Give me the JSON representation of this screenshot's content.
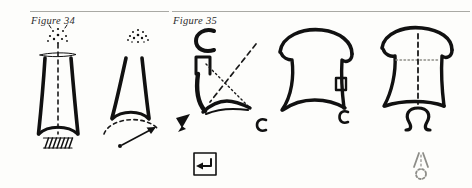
{
  "page": {
    "background_color": "#fdfdfb",
    "ink_color": "#111111",
    "rule_color": "#a9a9a4",
    "faint_ink_color": "#8d8d88"
  },
  "panels": [
    {
      "id": "figure-34",
      "label": "Figure 34",
      "rule": true,
      "drawings": [
        {
          "id": "drawing-1",
          "description": "Tapering vessel outline with dashed vertical axis, horizontal crossbar at the neck, a small burst of dots above, a curved base arc and a hatched block beneath",
          "elements": [
            "burst-dots",
            "dashed-center-axis",
            "horizontal-crossbar",
            "tapered-body-left-stroke",
            "tapered-body-right-stroke",
            "base-arc",
            "hatch-block"
          ]
        },
        {
          "id": "drawing-2",
          "description": "V-shaped vessel outline with a burst of dots above, a dashed arc across the base and an arrow rising from a dot at lower left",
          "elements": [
            "burst-dots",
            "v-left-stroke",
            "v-right-stroke",
            "base-curve",
            "dashed-arc",
            "arrow",
            "origin-dot"
          ]
        }
      ]
    },
    {
      "id": "figure-35",
      "label": "Figure 35",
      "rule": true,
      "drawings": [
        {
          "id": "drawing-3",
          "description": "Letter C above a narrow tube, a curving downstroke, crossing dashed and dotted guide lines, a solid wedge at lower left and a small letter c at lower right",
          "glyphs": [
            "C",
            "c"
          ],
          "elements": [
            "c-glyph-top",
            "tube",
            "curved-downstroke",
            "dashed-guide",
            "dotted-guide",
            "sweep-stroke",
            "wedge",
            "c-glyph-small"
          ]
        },
        {
          "id": "drawing-4",
          "description": "Domed bell outline with an inner notch, a sweeping base curve and a small letter c at lower right",
          "glyphs": [
            "c"
          ],
          "elements": [
            "dome-outline",
            "left-downstroke",
            "right-downstroke",
            "notch",
            "base-curve",
            "c-glyph-small"
          ]
        },
        {
          "id": "drawing-5",
          "description": "Domed bell outline with a dashed vertical axis, a horizontal base bar and an omega symbol below",
          "glyphs": [
            "Ω"
          ],
          "elements": [
            "dome-outline",
            "left-downstroke",
            "right-downstroke",
            "dashed-center-axis",
            "base-bar",
            "omega-glyph"
          ]
        }
      ]
    }
  ],
  "marks": [
    {
      "id": "return-mark",
      "description": "Square outline enclosing a small left-pointing hook, a return or enter symbol",
      "glyph": "↵"
    },
    {
      "id": "pendant-mark",
      "description": "Faint chevron above a small open circle",
      "glyph": "╱╲○"
    }
  ]
}
